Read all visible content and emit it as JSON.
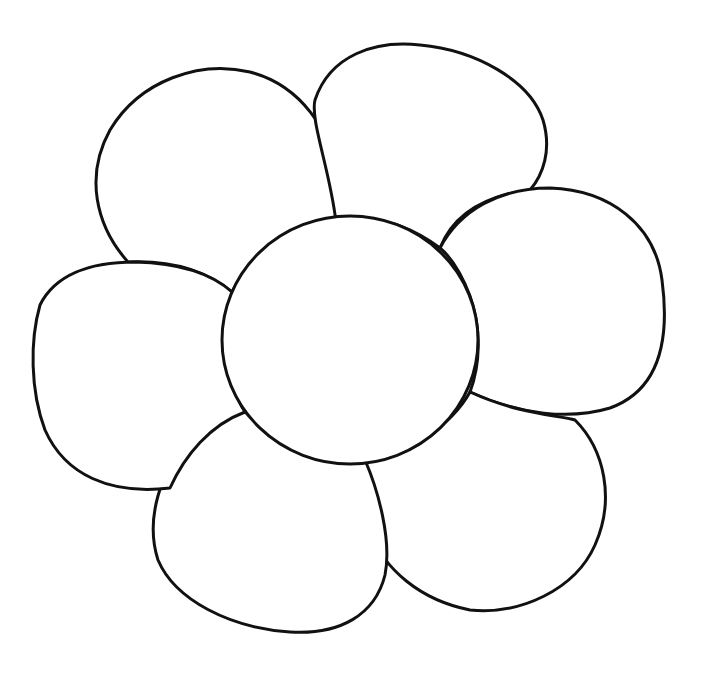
{
  "image": {
    "subject": "Flower outline coloring page",
    "background_color": "#ffffff",
    "stroke_color": "#111111",
    "petal_count": 6,
    "petals": [
      {
        "name": "top-left-petal"
      },
      {
        "name": "top-right-petal"
      },
      {
        "name": "right-petal"
      },
      {
        "name": "bottom-right-petal"
      },
      {
        "name": "bottom-left-petal"
      },
      {
        "name": "left-petal"
      }
    ],
    "center": {
      "name": "flower-center",
      "cx": 350,
      "cy": 340,
      "rx": 128,
      "ry": 124
    }
  }
}
